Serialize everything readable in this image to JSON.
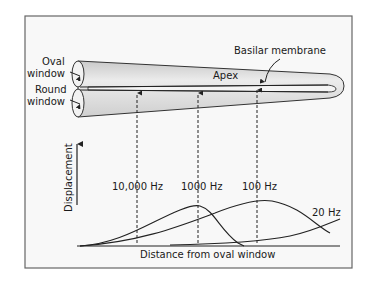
{
  "figure": {
    "labels": {
      "oval_window_line1": "Oval",
      "oval_window_line2": "window",
      "round_window_line1": "Round",
      "round_window_line2": "window",
      "apex": "Apex",
      "basilar_membrane": "Basilar membrane",
      "y_axis": "Displacement",
      "x_axis": "Distance from oval window"
    },
    "frequencies": [
      {
        "label": "10,000 Hz"
      },
      {
        "label": "1000 Hz"
      },
      {
        "label": "100 Hz"
      },
      {
        "label": "20 Hz"
      }
    ],
    "colors": {
      "tube_fill": "#d9d9d9",
      "tube_highlight": "#f2f2f2",
      "line": "#2a2a2a",
      "frame": "#555555",
      "background": "#f7f7f7"
    }
  }
}
